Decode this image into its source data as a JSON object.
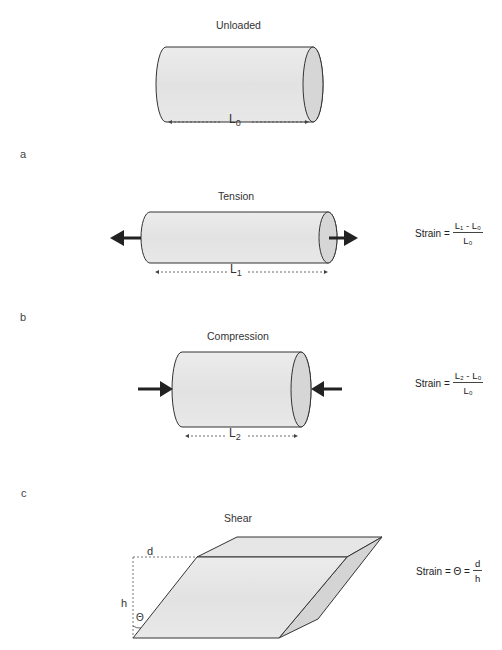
{
  "figure": {
    "unloaded": {
      "title": "Unloaded",
      "length_label": "L",
      "length_sub": "0"
    },
    "panel_a": {
      "letter": "a",
      "title": "Tension",
      "length_label": "L",
      "length_sub": "1",
      "formula": {
        "lhs": "Strain =",
        "numerator": "L₁ - L₀",
        "denominator": "L₀"
      }
    },
    "panel_b": {
      "letter": "b",
      "title": "Compression",
      "length_label": "L",
      "length_sub": "2",
      "formula": {
        "lhs": "Strain =",
        "numerator": "L₂ - L₀",
        "denominator": "L₀"
      }
    },
    "panel_c": {
      "letter": "c",
      "title": "Shear",
      "d_label": "d",
      "h_label": "h",
      "theta_label": "Θ",
      "formula": {
        "lhs": "Strain = Θ =",
        "numerator": "d",
        "denominator": "h"
      }
    },
    "colors": {
      "fill": "#e4e4e4",
      "end_cap": "#d6d6d6",
      "stroke": "#333333",
      "arrow": "#222222"
    }
  }
}
